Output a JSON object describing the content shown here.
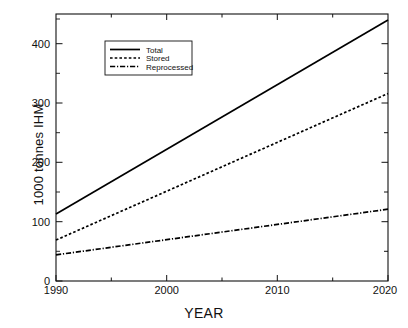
{
  "chart_data": {
    "type": "line",
    "title": "",
    "xlabel": "YEAR",
    "ylabel": "1000 tonnes IHM",
    "xlim": [
      1990,
      2020
    ],
    "ylim": [
      0,
      450
    ],
    "xticks": [
      1990,
      2000,
      2010,
      2020
    ],
    "yticks": [
      0,
      100,
      200,
      300,
      400
    ],
    "xtick_labels": [
      "1990",
      "2000",
      "2010",
      "2020"
    ],
    "ytick_labels": [
      "0",
      "100",
      "200",
      "300",
      "400"
    ],
    "grid": false,
    "legend_position": "upper-left-inside",
    "x": [
      1990,
      2020
    ],
    "series": [
      {
        "name": "Total",
        "style": "solid",
        "color": "#000000",
        "values": [
          113,
          440
        ]
      },
      {
        "name": "Stored",
        "style": "dotted",
        "color": "#000000",
        "values": [
          69,
          316
        ]
      },
      {
        "name": "Reprocessed",
        "style": "dashdot",
        "color": "#000000",
        "values": [
          44,
          121
        ]
      }
    ]
  },
  "legend": {
    "entries": [
      {
        "label": "Total"
      },
      {
        "label": "Stored"
      },
      {
        "label": "Reprocessed"
      }
    ]
  },
  "axes": {
    "x_label": "YEAR",
    "y_label": "1000 tonnes IHM"
  }
}
